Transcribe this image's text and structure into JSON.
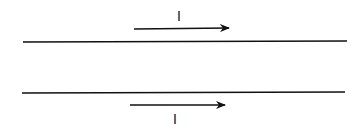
{
  "diagram": {
    "wires": [
      {
        "id": "top-wire",
        "x1": 23,
        "y1": 42,
        "x2": 347,
        "y2": 41
      },
      {
        "id": "bottom-wire",
        "x1": 22,
        "y1": 93,
        "x2": 345,
        "y2": 92
      }
    ],
    "currents": [
      {
        "id": "top-current",
        "label": "I",
        "direction": "right",
        "arrow": {
          "x1": 134,
          "y1": 29,
          "x2": 229,
          "y2": 28
        },
        "label_pos": {
          "x": 179,
          "y": 21
        }
      },
      {
        "id": "bottom-current",
        "label": "I",
        "direction": "right",
        "arrow": {
          "x1": 130,
          "y1": 105,
          "x2": 225,
          "y2": 105
        },
        "label_pos": {
          "x": 175,
          "y": 124
        }
      }
    ],
    "colors": {
      "line": "#111111",
      "background": "#ffffff"
    }
  }
}
